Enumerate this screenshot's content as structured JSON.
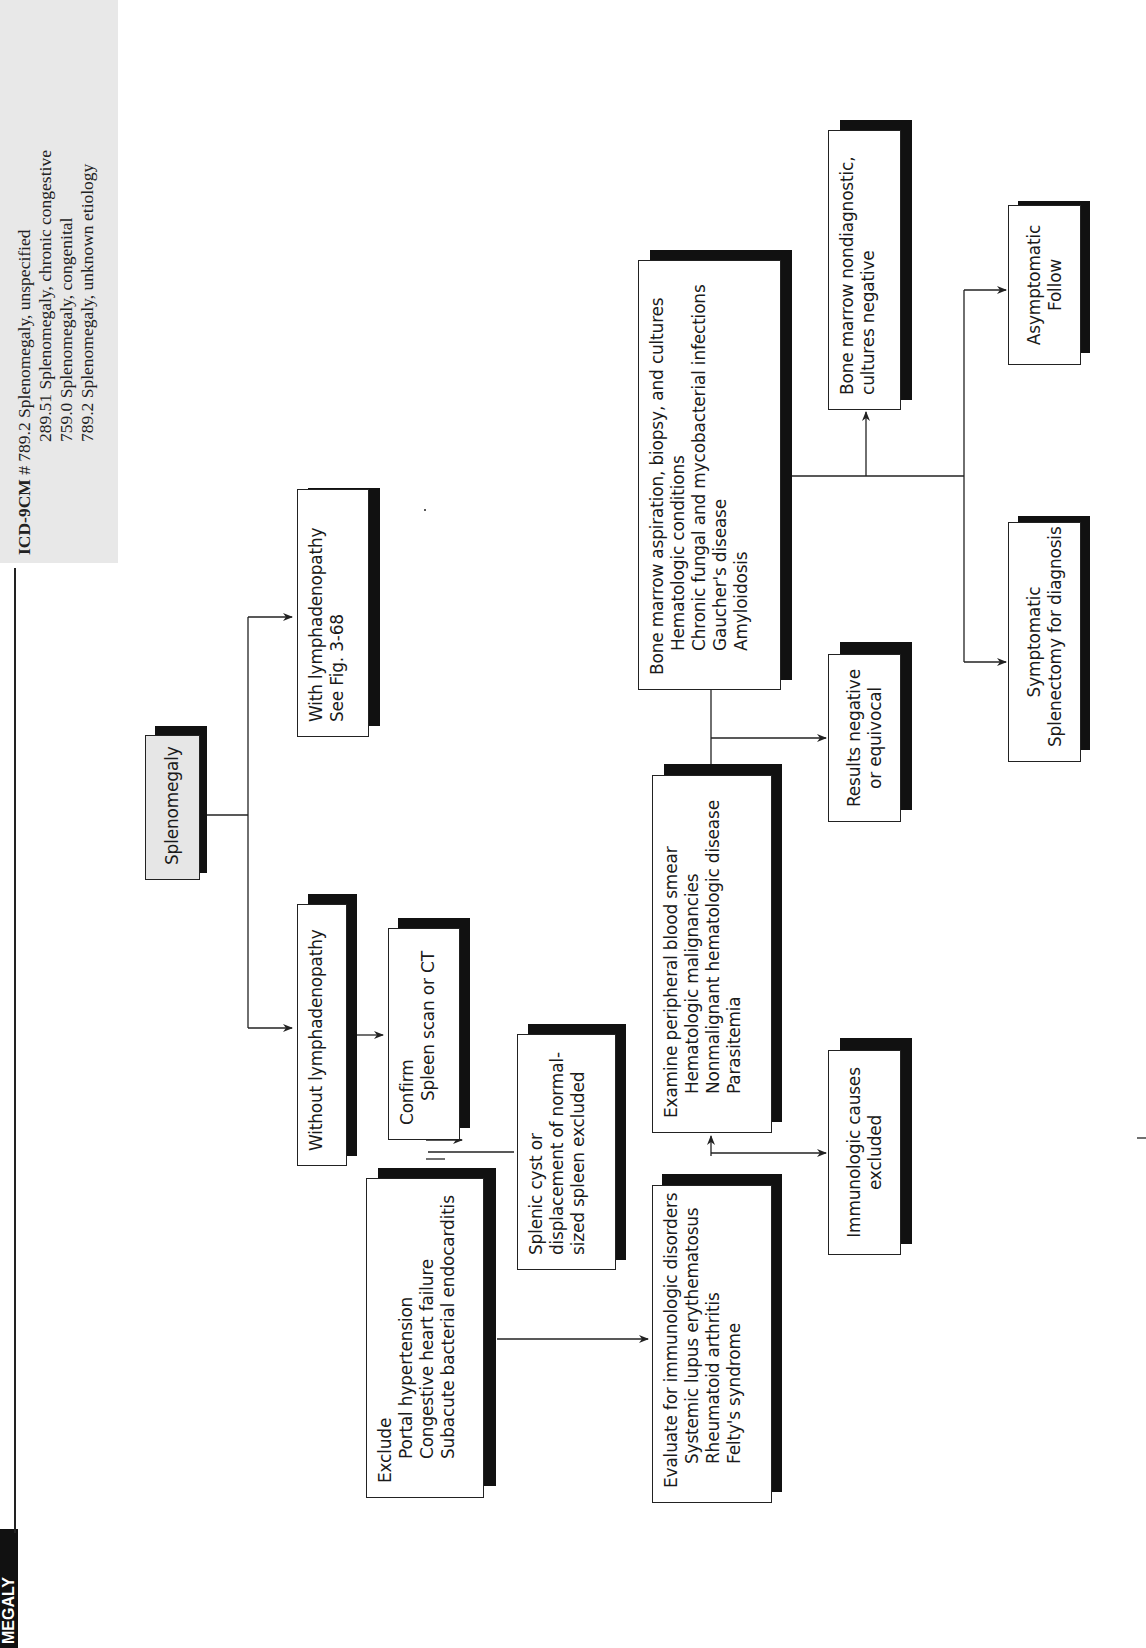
{
  "header": {
    "section_tab": "MEGALY",
    "icd": {
      "label": "ICD-9CM",
      "marker": "#",
      "codes": [
        "789.2 Splenomegaly, unspecified",
        "289.51 Splenomegaly, chronic congestive",
        "759.0 Splenomegaly, congenital",
        "789.2 Splenomegaly, unknown etiology"
      ]
    }
  },
  "flowchart": {
    "root": {
      "label": "Splenomegaly"
    },
    "with_lymph": {
      "lines": [
        "With lymphadenopathy",
        "See Fig. 3-68"
      ]
    },
    "without_lymph": {
      "lines": [
        "Without lymphadenopathy"
      ]
    },
    "confirm": {
      "lines": [
        "Confirm",
        "Spleen scan or CT"
      ]
    },
    "cyst": {
      "lines": [
        "Splenic cyst or",
        "displacement of normal-",
        "sized spleen excluded"
      ]
    },
    "exclude": {
      "title": "Exclude",
      "items": [
        "Portal hypertension",
        "Congestive heart failure",
        "Subacute bacterial endocarditis"
      ]
    },
    "immuno_eval": {
      "title": "Evaluate for immunologic disorders",
      "items": [
        "Systemic lupus erythematosus",
        "Rheumatoid arthritis",
        "Felty's syndrome"
      ]
    },
    "immuno_excluded": {
      "lines": [
        "Immunologic causes",
        "excluded"
      ]
    },
    "smear": {
      "title": "Examine peripheral blood smear",
      "items": [
        "Hematologic malignancies",
        "Nonmalignant hematologic disease",
        "Parasitemia"
      ]
    },
    "results_neg": {
      "lines": [
        "Results negative",
        "or equivocal"
      ]
    },
    "marrow": {
      "title": "Bone marrow aspiration, biopsy, and cultures",
      "items": [
        "Hematologic conditions",
        "Chronic fungal and mycobacterial infections",
        "Gaucher's disease",
        "Amyloidosis"
      ]
    },
    "marrow_neg": {
      "lines": [
        "Bone marrow nondiagnostic,",
        "cultures negative"
      ]
    },
    "symptomatic": {
      "lines": [
        "Symptomatic",
        "Splenectomy for diagnosis"
      ]
    },
    "asymptomatic": {
      "lines": [
        "Asymptomatic",
        "Follow"
      ]
    }
  },
  "colors": {
    "root_fill": "#e6e6e6",
    "shadow": "#111111",
    "icd_band": "#e8e8e8",
    "line": "#222222"
  }
}
